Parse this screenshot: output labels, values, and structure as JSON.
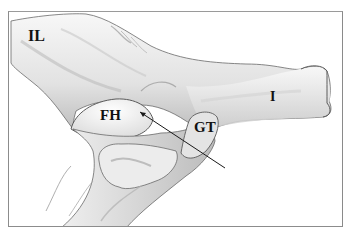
{
  "figure": {
    "labels": {
      "ilium": "IL",
      "ischium": "I",
      "femoral_head": "FH",
      "greater_trochanter": "GT"
    },
    "colors": {
      "border": "#8c8c8c",
      "bone_light": "#f4f4f4",
      "bone_shade": "#c9c9c9",
      "outline": "#5a5a5a",
      "pointer_line": "#1a1a1a",
      "label": "#111111"
    }
  }
}
